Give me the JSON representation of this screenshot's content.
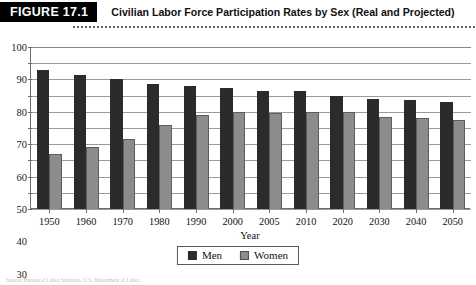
{
  "figure": {
    "badge_label": "FIGURE 17.1",
    "title": "Civilian Labor Force Participation Rates by Sex (Real and Projected)"
  },
  "source_note": "Source: Bureau of Labor Statistics, U.S. Department of Labor.",
  "colors": {
    "men": "#2b2b2b",
    "women": "#8c8c8c",
    "badge_bg": "#000000",
    "badge_text": "#ffffff",
    "grid": "#9a9a9a",
    "axis": "#6d6d6d"
  },
  "legend": {
    "position": "bottom-center",
    "items": [
      {
        "label": "Men",
        "color": "#2b2b2b"
      },
      {
        "label": "Women",
        "color": "#8c8c8c"
      }
    ]
  },
  "chart_data": {
    "type": "bar",
    "title": "Civilian Labor Force Participation Rates by Sex (Real and Projected)",
    "xlabel": "Year",
    "ylabel": "",
    "ylim": [
      0,
      100
    ],
    "yticks": [
      0,
      10,
      20,
      30,
      40,
      50,
      60,
      70,
      80,
      90,
      100
    ],
    "grid": true,
    "categories": [
      "1950",
      "1960",
      "1970",
      "1980",
      "1990",
      "2000",
      "2005",
      "2010",
      "2020",
      "2030",
      "2040",
      "2050"
    ],
    "series": [
      {
        "name": "Men",
        "color": "#2b2b2b",
        "values": [
          86,
          83,
          80,
          77,
          76,
          75,
          73,
          73,
          70,
          68,
          67,
          66
        ]
      },
      {
        "name": "Women",
        "color": "#8c8c8c",
        "values": [
          34,
          38,
          43,
          52,
          58,
          60,
          59,
          60,
          60,
          57,
          56,
          55
        ]
      }
    ]
  }
}
